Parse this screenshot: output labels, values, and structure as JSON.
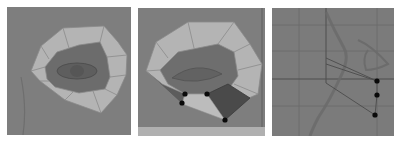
{
  "figure": {
    "panels": [
      {
        "id": "panel-1",
        "description": "eye-socket-ring-polygon-mesh",
        "background_color": "#7e7e7e",
        "ring_color": "#b4b4b4",
        "inner_color": "#6c6c6c"
      },
      {
        "id": "panel-2",
        "description": "ring-mesh-with-selected-vertices",
        "background_color": "#7e7e7e",
        "ring_color": "#b4b4b4",
        "selected_face_color": "#4a4a4a",
        "bottom_strip_color": "#b0b0b0",
        "vertices": [
          [
            185,
            94
          ],
          [
            207,
            94
          ],
          [
            182,
            103
          ],
          [
            225,
            120
          ]
        ]
      },
      {
        "id": "panel-3",
        "description": "side-view-grid-with-vertices",
        "background_color": "#7b7b7b",
        "grid_color": "#5a5a5a",
        "vertices": [
          [
            377,
            81
          ],
          [
            377,
            95
          ],
          [
            375,
            115
          ]
        ]
      }
    ],
    "vertex_color": "#0a0a0a"
  }
}
